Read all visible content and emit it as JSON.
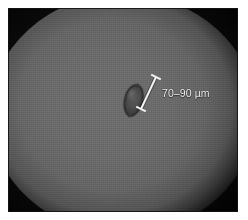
{
  "figure": {
    "kind": "light-microscopy-micrograph",
    "alt_description": "Bright-field micrograph of a single lens-shaped cell on a grey illuminated field",
    "plate": {
      "background_color": "#0a0a0a",
      "field_color": "#6b6b6b",
      "field_shape": "circle",
      "vignette": true
    },
    "specimen": {
      "name": "cell",
      "shape": "lens-ellipse",
      "fill_color": "#4a4a4a",
      "outline_color": "#2e2e2e",
      "rotation_deg": 14
    },
    "annotation": {
      "type": "scale-bar",
      "label": "70–90 µm",
      "value_min": 70,
      "value_max": 90,
      "unit": "µm",
      "color": "#f2f2f2",
      "bar": {
        "x1": 148,
        "y1": 69,
        "x2": 133,
        "y2": 101,
        "cap_style": "perpendicular-tick",
        "stroke_width": 2
      }
    }
  }
}
